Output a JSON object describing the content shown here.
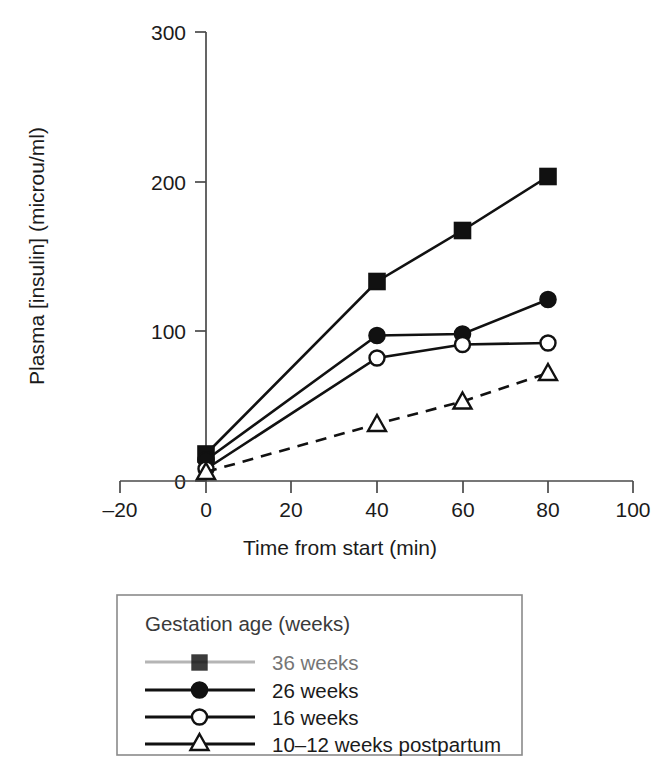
{
  "chart_data": {
    "type": "line",
    "title": "",
    "xlabel": "Time from start (min)",
    "ylabel": "Plasma [insulin] (microu/ml)",
    "xlim": [
      -20,
      100
    ],
    "ylim": [
      0,
      300
    ],
    "xticks": [
      -20,
      0,
      20,
      40,
      60,
      80,
      100
    ],
    "xtick_labels": [
      "–20",
      "0",
      "20",
      "40",
      "60",
      "80",
      "100"
    ],
    "yticks": [
      0,
      100,
      200,
      300
    ],
    "ytick_labels": [
      "0",
      "100",
      "200",
      "300"
    ],
    "grid": false,
    "legend_position": "below-axes",
    "legend_title": "Gestation age (weeks)",
    "x": [
      0,
      40,
      60,
      80
    ],
    "series": [
      {
        "name": "36 weeks",
        "marker": "filled-square",
        "linestyle": "solid",
        "values": [
          18,
          133,
          167,
          203
        ]
      },
      {
        "name": "26 weeks",
        "marker": "filled-circle",
        "linestyle": "solid",
        "values": [
          14,
          97,
          98,
          121
        ]
      },
      {
        "name": "16 weeks",
        "marker": "open-circle",
        "linestyle": "solid",
        "values": [
          8,
          82,
          91,
          92
        ]
      },
      {
        "name": "10–12 weeks postpartum",
        "marker": "open-triangle",
        "linestyle": "dashed",
        "values": [
          6,
          38,
          53,
          72
        ]
      }
    ]
  },
  "axes": {
    "y_axis_label": "Plasma [insulin] (microu/ml)",
    "x_axis_label": "Time from start (min)",
    "y_tick_labels": [
      "300",
      "200",
      "100",
      "0"
    ],
    "x_tick_labels": [
      "–20",
      "0",
      "20",
      "40",
      "60",
      "80",
      "100"
    ]
  },
  "legend": {
    "title": "Gestation age (weeks)",
    "entries": [
      {
        "label": "36 weeks",
        "marker": "filled-square",
        "linestyle": "solid"
      },
      {
        "label": "26 weeks",
        "marker": "filled-circle",
        "linestyle": "solid"
      },
      {
        "label": "16 weeks",
        "marker": "open-circle",
        "linestyle": "solid"
      },
      {
        "label": "10–12 weeks postpartum",
        "marker": "open-triangle",
        "linestyle": "solid"
      }
    ]
  },
  "colors": {
    "ink": "#111111",
    "axis": "#4a4a4a",
    "legend_border": "#8a8a8a",
    "background": "#ffffff"
  }
}
